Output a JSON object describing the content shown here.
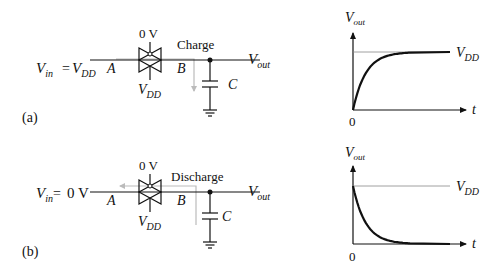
{
  "panels": [
    {
      "id": "a",
      "label": "(a)",
      "vin_label": "V",
      "vin_sub": "in",
      "vin_eq": "=",
      "vin_value_main": "V",
      "vin_value_sub": "DD",
      "node_a": "A",
      "node_b": "B",
      "gate_top": "0 V",
      "gate_bottom_main": "V",
      "gate_bottom_sub": "DD",
      "action": "Charge",
      "cap_label": "C",
      "vout_main": "V",
      "vout_sub": "out",
      "graph": {
        "y_label_main": "V",
        "y_label_sub": "out",
        "x_label": "t",
        "origin": "0",
        "level_main": "V",
        "level_sub": "DD",
        "shape": "rising-exponential"
      }
    },
    {
      "id": "b",
      "label": "(b)",
      "vin_label": "V",
      "vin_sub": "in",
      "vin_eq": "=",
      "vin_value_main": "0 V",
      "vin_value_sub": "",
      "node_a": "A",
      "node_b": "B",
      "gate_top": "0 V",
      "gate_bottom_main": "V",
      "gate_bottom_sub": "DD",
      "action": "Discharge",
      "cap_label": "C",
      "vout_main": "V",
      "vout_sub": "out",
      "graph": {
        "y_label_main": "V",
        "y_label_sub": "out",
        "x_label": "t",
        "origin": "0",
        "level_main": "V",
        "level_sub": "DD",
        "shape": "falling-exponential"
      }
    }
  ]
}
